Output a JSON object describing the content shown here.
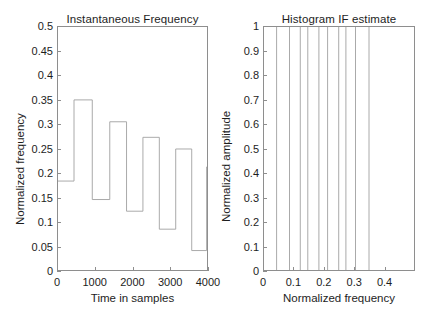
{
  "figure": {
    "background_color": "#ffffff",
    "axis_color": "#8e8e8e",
    "line_color": "#a0a0a0",
    "text_color": "#1d1d1d",
    "panels": 2
  },
  "chart_data": [
    {
      "type": "line",
      "subplot": "left",
      "title": "Instantaneous Frequency",
      "xlabel": "Time in samples",
      "ylabel": "Normalized frequency",
      "xlim": [
        0,
        4000
      ],
      "ylim": [
        0,
        0.5
      ],
      "xticks": [
        0,
        1000,
        2000,
        3000,
        4000
      ],
      "xtick_labels": [
        "0",
        "1000",
        "2000",
        "3000",
        "4000"
      ],
      "yticks": [
        0,
        0.05,
        0.1,
        0.15,
        0.2,
        0.25,
        0.3,
        0.35,
        0.4,
        0.45,
        0.5
      ],
      "ytick_labels": [
        "0",
        "0.05",
        "0.1",
        "0.15",
        "0.2",
        "0.25",
        "0.3",
        "0.35",
        "0.4",
        "0.45",
        "0.5"
      ],
      "grid": false,
      "legend": null,
      "drawstyle": "steps-post",
      "series": [
        {
          "name": "instantaneous frequency",
          "x": [
            0,
            430,
            920,
            1390,
            1840,
            2280,
            2720,
            3160,
            3590,
            3990
          ],
          "values": [
            0.183,
            0.35,
            0.145,
            0.305,
            0.121,
            0.273,
            0.084,
            0.249,
            0.04,
            0.212
          ],
          "steps": [
            {
              "x_start": 0,
              "x_end": 430,
              "level": 0.183
            },
            {
              "x_start": 430,
              "x_end": 920,
              "level": 0.35
            },
            {
              "x_start": 920,
              "x_end": 1390,
              "level": 0.145
            },
            {
              "x_start": 1390,
              "x_end": 1840,
              "level": 0.305
            },
            {
              "x_start": 1840,
              "x_end": 2280,
              "level": 0.121
            },
            {
              "x_start": 2280,
              "x_end": 2720,
              "level": 0.273
            },
            {
              "x_start": 2720,
              "x_end": 3160,
              "level": 0.084
            },
            {
              "x_start": 3160,
              "x_end": 3590,
              "level": 0.249
            },
            {
              "x_start": 3590,
              "x_end": 3990,
              "level": 0.04
            },
            {
              "x_start": 3990,
              "x_end": 4000,
              "level": 0.212
            }
          ]
        }
      ]
    },
    {
      "type": "line",
      "subplot": "right",
      "title": "Histogram IF estimate",
      "xlabel": "Normalized frequency",
      "ylabel": "Normalized amplitude",
      "xlim": [
        0,
        0.5
      ],
      "ylim": [
        0,
        1
      ],
      "xticks": [
        0,
        0.1,
        0.2,
        0.3,
        0.4
      ],
      "xtick_labels": [
        "0",
        "0.1",
        "0.2",
        "0.3",
        "0.4"
      ],
      "yticks": [
        0,
        0.1,
        0.2,
        0.3,
        0.4,
        0.5,
        0.6,
        0.7,
        0.8,
        0.9,
        1
      ],
      "ytick_labels": [
        "0",
        "0.1",
        "0.2",
        "0.3",
        "0.4",
        "0.5",
        "0.6",
        "0.7",
        "0.8",
        "0.9",
        "1"
      ],
      "grid": false,
      "legend": null,
      "drawstyle": "vertical-stems",
      "series": [
        {
          "name": "histogram IF estimate stems",
          "x": [
            0.042,
            0.085,
            0.121,
            0.146,
            0.183,
            0.212,
            0.249,
            0.273,
            0.305,
            0.35
          ],
          "values": [
            1,
            1,
            1,
            1,
            1,
            1,
            1,
            1,
            1,
            1
          ]
        }
      ]
    }
  ]
}
